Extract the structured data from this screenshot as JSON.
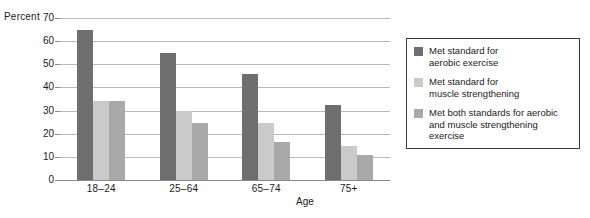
{
  "chart_data": {
    "type": "bar",
    "title": "",
    "subtitle": "",
    "xlabel": "Age",
    "ylabel": "Percent",
    "categories": [
      "18–24",
      "25–64",
      "65–74",
      "75+"
    ],
    "series": [
      {
        "name": "Met standard for\naerobic exercise",
        "color": "#6e6e6e",
        "values": [
          65,
          55,
          46,
          32.5
        ]
      },
      {
        "name": "Met standard for\nmuscle strengthening",
        "color": "#cacaca",
        "values": [
          34,
          30,
          24.5,
          14.5
        ]
      },
      {
        "name": "Met both standards for aerobic\nand muscle strengthening exercise",
        "color": "#a9a9a9",
        "values": [
          34,
          24.5,
          16.5,
          11
        ]
      }
    ],
    "ylim": [
      0,
      70
    ],
    "ytick_values": [
      0,
      10,
      20,
      30,
      40,
      50,
      60,
      70
    ],
    "ytick_labels": [
      "0",
      "10",
      "20",
      "30",
      "40",
      "50",
      "60",
      "70"
    ],
    "grid": true,
    "grid_axis": "y",
    "legend_position": "right",
    "legend_border": true
  },
  "axes": {
    "y_title": "Percent",
    "x_title": "Age"
  },
  "legend": {
    "entries": [
      {
        "label": "Met standard for\naerobic exercise",
        "color": "#6e6e6e"
      },
      {
        "label": "Met standard for\nmuscle strengthening",
        "color": "#cacaca"
      },
      {
        "label": "Met both standards for aerobic\nand muscle strengthening exercise",
        "color": "#a9a9a9"
      }
    ]
  },
  "colors": {
    "series_aerobic": "#6e6e6e",
    "series_muscle": "#cacaca",
    "series_both": "#a9a9a9",
    "gridline": "#b9b9b9",
    "axis": "#8a8a8a",
    "text": "#1a1a1a",
    "background": "#ffffff"
  }
}
